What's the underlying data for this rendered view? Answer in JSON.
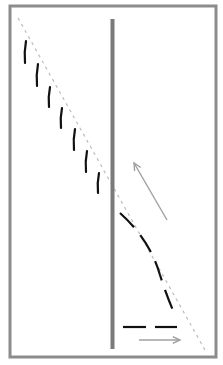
{
  "diagram": {
    "colors": {
      "frame": "#8c8c8c",
      "wall": "#7a7a7a",
      "guide_line": "#bdbdbd",
      "trajectory": "#111111",
      "arrow": "#a0a0a0",
      "background": "#ffffff"
    },
    "frame": {
      "x": 10,
      "y": 6,
      "width": 206,
      "height": 351
    },
    "wall": {
      "x": 112.5,
      "y1": 19,
      "y2": 349,
      "width": 4
    },
    "guide_line": {
      "x1": 18,
      "y1": 18,
      "x2": 205,
      "y2": 350
    },
    "left_dashes": [
      {
        "x1": 26,
        "y1": 41,
        "x2": 25,
        "y2": 63
      },
      {
        "x1": 38,
        "y1": 64,
        "x2": 37,
        "y2": 86
      },
      {
        "x1": 50,
        "y1": 87,
        "x2": 49,
        "y2": 107
      },
      {
        "x1": 62,
        "y1": 108,
        "x2": 61,
        "y2": 128
      },
      {
        "x1": 75,
        "y1": 129,
        "x2": 74,
        "y2": 150
      },
      {
        "x1": 87,
        "y1": 151,
        "x2": 86,
        "y2": 172
      },
      {
        "x1": 99,
        "y1": 173,
        "x2": 98,
        "y2": 193
      }
    ],
    "right_curve": {
      "path": "M 120 213 Q 150 240 160 275 Q 168 300 176 317"
    },
    "bottom_dashes": [
      {
        "x1": 123,
        "y1": 327,
        "x2": 146,
        "y2": 327
      },
      {
        "x1": 155,
        "y1": 327,
        "x2": 177,
        "y2": 327
      }
    ],
    "arrows": [
      {
        "name": "diagonal-arrow",
        "x1": 167,
        "y1": 220,
        "x2": 134,
        "y2": 163
      },
      {
        "name": "horizontal-arrow",
        "x1": 139,
        "y1": 340,
        "x2": 180,
        "y2": 340
      }
    ]
  }
}
